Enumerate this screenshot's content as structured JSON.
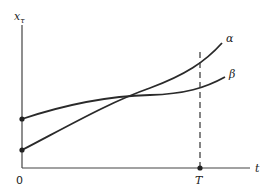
{
  "diagram": {
    "y_axis_label": "x",
    "y_axis_label_sub": "τ",
    "x_axis_label": "t",
    "origin_label": "0",
    "T_label": "T",
    "curves": [
      {
        "name": "alpha",
        "label": "α",
        "start": [
          22,
          150
        ],
        "end": [
          222,
          43
        ]
      },
      {
        "name": "beta",
        "label": "β",
        "start": [
          22,
          119
        ],
        "end": [
          225,
          77
        ]
      }
    ],
    "colors": {
      "line": "#2a2a2a",
      "background": "#ffffff"
    }
  }
}
